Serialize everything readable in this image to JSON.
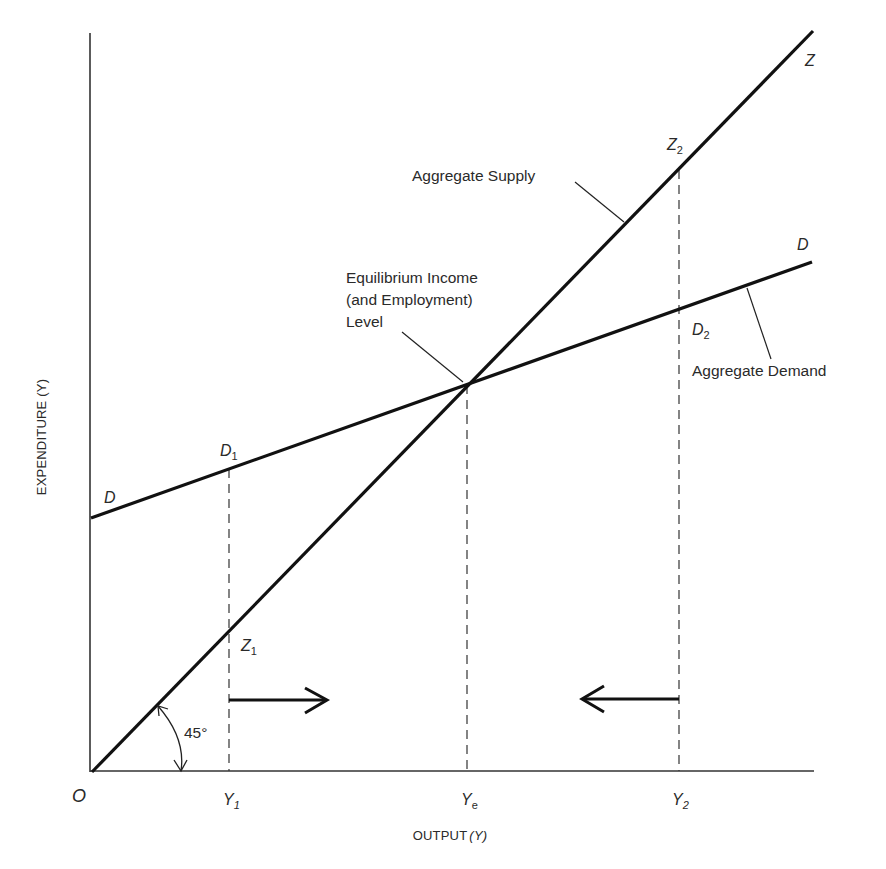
{
  "diagram": {
    "type": "keynesian-cross",
    "axes": {
      "y_label": "EXPENDITURE (Y)",
      "x_label_main": "OUTPUT",
      "x_label_var": "(Y)",
      "origin_label": "O"
    },
    "x_ticks": [
      {
        "base": "Y",
        "sub": "1"
      },
      {
        "base": "Y",
        "sub": "e"
      },
      {
        "base": "Y",
        "sub": "2"
      }
    ],
    "lines": {
      "supply": {
        "name": "Aggregate Supply",
        "end_label": "Z",
        "slope_deg": 45
      },
      "demand": {
        "name": "Aggregate Demand",
        "start_label": "D",
        "end_label": "D"
      }
    },
    "points": {
      "z1": {
        "base": "Z",
        "sub": "1"
      },
      "z2": {
        "base": "Z",
        "sub": "2"
      },
      "d1": {
        "base": "D",
        "sub": "1"
      },
      "d2": {
        "base": "D",
        "sub": "2"
      }
    },
    "annotations": {
      "equilibrium": [
        "Equilibrium Income",
        "(and Employment)",
        "Level"
      ],
      "angle": "45°"
    },
    "arrows": [
      {
        "from": "Y1",
        "direction": "right"
      },
      {
        "from": "Y2",
        "direction": "left"
      }
    ],
    "colors": {
      "line": "#111111",
      "text": "#2a2a2a",
      "axis": "#333333"
    }
  }
}
